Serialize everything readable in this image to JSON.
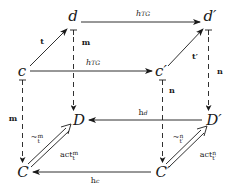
{
  "diagram": {
    "nodes": {
      "d": "d",
      "d_prime": "d′",
      "c": "c",
      "c_prime": "c′",
      "D": "D",
      "D_prime": "D′",
      "C": "C",
      "C_prime": "C′"
    },
    "labels": {
      "t": "t",
      "t_prime": "t′",
      "m_top": "m",
      "m_left": "m",
      "n_right": "n",
      "n_mid": "n",
      "h_top_base": "h",
      "h_top_sub": "TG",
      "h_mid_base": "h",
      "h_mid_sub": "TG",
      "h_d_base": "h",
      "h_d_sub": "d",
      "h_c_base": "h",
      "h_c_sub": "c",
      "sim_m_base": "~",
      "sim_m_sup": "m",
      "sim_m_sub": "t",
      "act_m_base": "act",
      "act_m_sup": "m",
      "act_m_sub": "t",
      "sim_n_base": "~",
      "sim_n_sup": "n",
      "sim_n_sub": "t′",
      "act_n_base": "act",
      "act_n_sup": "n",
      "act_n_sub": "t′"
    },
    "edges": [
      {
        "from": "d",
        "to": "d′",
        "label": "h_TG",
        "style": "solid"
      },
      {
        "from": "c",
        "to": "c′",
        "label": "h_TG",
        "style": "solid"
      },
      {
        "from": "c",
        "to": "d",
        "label": "t",
        "style": "solid"
      },
      {
        "from": "c′",
        "to": "d′",
        "label": "t′",
        "style": "solid"
      },
      {
        "from": "d",
        "to": "D",
        "label": "m",
        "style": "dashed-tee"
      },
      {
        "from": "d′",
        "to": "D′",
        "label": "n",
        "style": "dashed-tee"
      },
      {
        "from": "c",
        "to": "C",
        "label": "m",
        "style": "dashed-tee"
      },
      {
        "from": "c′",
        "to": "C′",
        "label": "n",
        "style": "dashed-tee"
      },
      {
        "from": "D′",
        "to": "D",
        "label": "h_d",
        "style": "solid"
      },
      {
        "from": "C′",
        "to": "C",
        "label": "h_c",
        "style": "solid"
      },
      {
        "from": "C",
        "to": "D",
        "label": "~^m_t / act^m_t",
        "style": "double"
      },
      {
        "from": "C′",
        "to": "D′",
        "label": "~^n_t′ / act^n_t′",
        "style": "double"
      }
    ],
    "colors": {
      "ink": "#1a1a1a",
      "background": "#ffffff"
    }
  }
}
